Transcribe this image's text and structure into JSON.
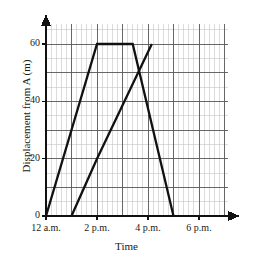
{
  "chart_data": {
    "type": "line",
    "title": "",
    "xlabel": "Time",
    "ylabel": "Displacement from A (m)",
    "xlim": [
      0,
      7.3
    ],
    "ylim": [
      0,
      68
    ],
    "grid": true,
    "grid_minor": true,
    "legend": "none",
    "x_tick_labels": [
      "12 a.m.",
      "2 p.m.",
      "4 p.m.",
      "6 p.m."
    ],
    "x_tick_values": [
      0,
      2,
      4,
      6
    ],
    "y_tick_labels": [
      "0",
      "20",
      "40",
      "60"
    ],
    "y_tick_values": [
      0,
      20,
      40,
      60
    ],
    "x_unit_hours_from_12": 1,
    "series": [
      {
        "name": "journey-outbound",
        "points": [
          {
            "x": 0,
            "y": 0
          },
          {
            "x": 2,
            "y": 60
          },
          {
            "x": 3.4,
            "y": 60
          },
          {
            "x": 5,
            "y": 0
          }
        ]
      },
      {
        "name": "journey-return",
        "points": [
          {
            "x": 1,
            "y": 0
          },
          {
            "x": 2,
            "y": 20
          },
          {
            "x": 4.15,
            "y": 60
          }
        ]
      }
    ],
    "colors": {
      "line": "#1a1a1a",
      "axis": "#1a1a1a",
      "grid_major": "#4a4a4a",
      "grid_minor": "#bdbdbd",
      "background": "#ffffff"
    }
  },
  "axes": {
    "x_axis_name": "Time",
    "y_axis_name": "Displacement from A (m)"
  }
}
